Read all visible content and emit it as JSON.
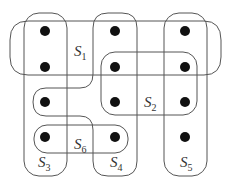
{
  "diagram": {
    "type": "set-system / hypergraph",
    "stroke_color": "#555555",
    "dot_color": "#111111",
    "dots": [
      {
        "x": 45,
        "y": 31
      },
      {
        "x": 115,
        "y": 31
      },
      {
        "x": 185,
        "y": 31
      },
      {
        "x": 45,
        "y": 67
      },
      {
        "x": 115,
        "y": 67
      },
      {
        "x": 185,
        "y": 67
      },
      {
        "x": 45,
        "y": 102
      },
      {
        "x": 115,
        "y": 102
      },
      {
        "x": 185,
        "y": 102
      },
      {
        "x": 45,
        "y": 137
      },
      {
        "x": 115,
        "y": 137
      },
      {
        "x": 185,
        "y": 137
      }
    ],
    "sets": [
      {
        "id": "S1",
        "letter": "S",
        "sub": "1",
        "label_x": 74,
        "label_y": 44
      },
      {
        "id": "S2",
        "letter": "S",
        "sub": "2",
        "label_x": 144,
        "label_y": 95
      },
      {
        "id": "S3",
        "letter": "S",
        "sub": "3",
        "label_x": 38,
        "label_y": 155
      },
      {
        "id": "S4",
        "letter": "S",
        "sub": "4",
        "label_x": 110,
        "label_y": 155
      },
      {
        "id": "S5",
        "letter": "S",
        "sub": "5",
        "label_x": 180,
        "label_y": 155
      },
      {
        "id": "S6",
        "letter": "S",
        "sub": "6",
        "label_x": 74,
        "label_y": 137
      }
    ]
  }
}
